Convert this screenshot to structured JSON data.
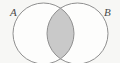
{
  "figure": {
    "type": "venn-diagram",
    "set_count": 2,
    "background_color": "#f7f7f5",
    "stroke_color": "#8f8f8f",
    "stroke_width": 1,
    "fill_color": "#ffffff",
    "intersection_fill_color": "#c9c9c9",
    "shaded_region": "intersection",
    "labels": {
      "left": "A",
      "right": "B"
    },
    "circles": [
      {
        "name": "left-circle",
        "label": "A",
        "cx": 43.5,
        "cy": 33.5,
        "r": 30.5
      },
      {
        "name": "right-circle",
        "label": "B",
        "cx": 77.5,
        "cy": 33.5,
        "r": 30.5
      }
    ],
    "intersection_points": [
      {
        "x": 60.5,
        "y": 12.0
      },
      {
        "x": 60.5,
        "y": 55.0
      }
    ]
  }
}
